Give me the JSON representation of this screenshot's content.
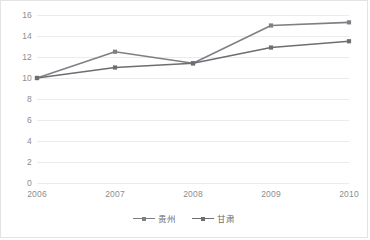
{
  "chart_data": {
    "type": "line",
    "title": "",
    "xlabel": "",
    "ylabel": "",
    "categories": [
      "2006",
      "2007",
      "2008",
      "2009",
      "2010"
    ],
    "series": [
      {
        "name": "贵州",
        "values": [
          10.0,
          12.5,
          11.4,
          15.0,
          15.3
        ],
        "color": "#7f7f86",
        "marker": "square"
      },
      {
        "name": "甘肃",
        "values": [
          10.0,
          11.0,
          11.4,
          12.9,
          13.5
        ],
        "color": "#6e6e72",
        "marker": "square"
      }
    ],
    "ylim": [
      0,
      16
    ],
    "ytick_values": [
      0,
      2,
      4,
      6,
      8,
      10,
      12,
      14,
      16
    ],
    "ytick_labels": [
      "0",
      "2",
      "4",
      "6",
      "8",
      "10",
      "12",
      "14",
      "16"
    ],
    "grid": "horizontal",
    "grid_color": "#ebebeb",
    "legend_position": "bottom-center",
    "plot_background": "#ffffff",
    "border_color": "#e3e3e3",
    "tick_label_color": "#8d8d8d"
  }
}
